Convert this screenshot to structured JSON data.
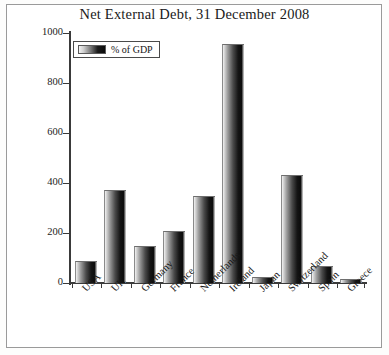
{
  "chart_data": {
    "type": "bar",
    "title": "Net External Debt, 31 December 2008",
    "xlabel": "",
    "ylabel": "",
    "ylim": [
      0,
      1000
    ],
    "yticks": [
      0,
      200,
      400,
      600,
      800,
      1000
    ],
    "ytick_labels": [
      "0",
      "200",
      "400",
      "600",
      "800",
      "1000"
    ],
    "grid": false,
    "legend": {
      "position": "top-left",
      "entries": [
        {
          "name": "% of GDP",
          "swatch": "gradient-grey-black"
        }
      ]
    },
    "categories": [
      "USA",
      "UK",
      "Germany",
      "France",
      "Netherlands",
      "Ireland",
      "Japan",
      "Switzerland",
      "Spain",
      "Greece"
    ],
    "series": [
      {
        "name": "% of GDP",
        "values": [
          90,
          372,
          150,
          208,
          350,
          956,
          25,
          432,
          70,
          18
        ]
      }
    ]
  },
  "legend": {
    "label": "% of GDP"
  }
}
